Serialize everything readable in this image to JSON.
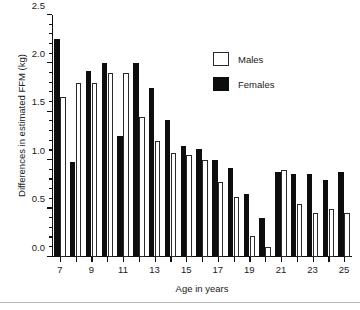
{
  "chart_data": {
    "type": "bar",
    "title": "",
    "xlabel": "Age in years",
    "ylabel": "Differences in estimated FFM (kg)",
    "categories": [
      7,
      8,
      9,
      10,
      11,
      12,
      13,
      14,
      15,
      16,
      17,
      18,
      19,
      20,
      21,
      22,
      23,
      24,
      25
    ],
    "xtick_labels": [
      "7",
      "9",
      "11",
      "13",
      "15",
      "17",
      "19",
      "21",
      "23",
      "25"
    ],
    "xtick_values": [
      7,
      9,
      11,
      13,
      15,
      17,
      19,
      21,
      23,
      25
    ],
    "ytick_labels": [
      "0.0",
      "0.5",
      "1.0",
      "1.5",
      "2.0",
      "2.5"
    ],
    "ytick_values": [
      0.0,
      0.5,
      1.0,
      1.5,
      2.0,
      2.5
    ],
    "ylim": [
      0.0,
      2.5
    ],
    "y_minor_step": 0.1,
    "grid": false,
    "legend_position": "upper-right",
    "series": [
      {
        "name": "Males",
        "color": "#ffffff",
        "edge_color": "#2a2a2a",
        "values": [
          1.65,
          1.8,
          1.8,
          1.9,
          1.9,
          1.45,
          1.2,
          1.07,
          1.05,
          1.0,
          0.78,
          0.62,
          0.22,
          0.1,
          0.9,
          0.55,
          0.45,
          0.5,
          0.45
        ]
      },
      {
        "name": "Females",
        "color": "#0d0d0d",
        "edge_color": "#0d0d0d",
        "values": [
          2.25,
          0.98,
          1.92,
          2.0,
          1.25,
          2.0,
          1.75,
          1.42,
          1.15,
          1.12,
          1.0,
          0.92,
          0.65,
          0.4,
          0.88,
          0.86,
          0.86,
          0.8,
          0.88
        ]
      }
    ]
  },
  "legend": {
    "items": [
      {
        "label": "Males",
        "swatch": "white-square"
      },
      {
        "label": "Females",
        "swatch": "black-square"
      }
    ]
  }
}
